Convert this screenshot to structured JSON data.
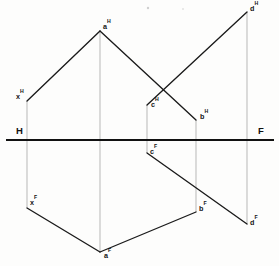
{
  "figure": {
    "type": "descriptive-geometry-projection",
    "canvas": {
      "width": 279,
      "height": 266,
      "background": "#fdfdfc"
    }
  },
  "colors": {
    "line": "#1a1a1a",
    "ground_line": "#111111",
    "projector": "#b4b4b4",
    "label": "#141414",
    "background": "#fdfdfc"
  },
  "ground_line": {
    "name": "folding-line",
    "y": 140,
    "x_start": 6,
    "x_end": 274,
    "left_label": "H",
    "right_label": "F",
    "left_label_x": 16,
    "left_label_y": 134,
    "right_label_x": 258,
    "right_label_y": 134
  },
  "points": [
    {
      "id": "xH",
      "base": "x",
      "plane": "H",
      "x": 27,
      "y": 101,
      "label_x": 16,
      "label_y": 99,
      "label_anchor": "start"
    },
    {
      "id": "aH",
      "base": "a",
      "plane": "H",
      "x": 100,
      "y": 31,
      "label_x": 103,
      "label_y": 29,
      "label_anchor": "start"
    },
    {
      "id": "cH",
      "base": "c",
      "plane": "H",
      "x": 147,
      "y": 105,
      "label_x": 151,
      "label_y": 107,
      "label_anchor": "start"
    },
    {
      "id": "bH",
      "base": "b",
      "plane": "H",
      "x": 196,
      "y": 120,
      "label_x": 200,
      "label_y": 119,
      "label_anchor": "start"
    },
    {
      "id": "dH",
      "base": "d",
      "plane": "H",
      "x": 247,
      "y": 12,
      "label_x": 250,
      "label_y": 11,
      "label_anchor": "start"
    },
    {
      "id": "xF",
      "base": "x",
      "plane": "F",
      "x": 27,
      "y": 208,
      "label_x": 30,
      "label_y": 205,
      "label_anchor": "start"
    },
    {
      "id": "aF",
      "base": "a",
      "plane": "F",
      "x": 100,
      "y": 252,
      "label_x": 104,
      "label_y": 258,
      "label_anchor": "start"
    },
    {
      "id": "cF",
      "base": "c",
      "plane": "F",
      "x": 147,
      "y": 153,
      "label_x": 150,
      "label_y": 154,
      "label_anchor": "start"
    },
    {
      "id": "bF",
      "base": "b",
      "plane": "F",
      "x": 196,
      "y": 212,
      "label_x": 199,
      "label_y": 211,
      "label_anchor": "start"
    },
    {
      "id": "dF",
      "base": "d",
      "plane": "F",
      "x": 247,
      "y": 224,
      "label_x": 250,
      "label_y": 225,
      "label_anchor": "start"
    }
  ],
  "segments": [
    {
      "name": "segment-xH-aH",
      "from": "xH",
      "to": "aH",
      "style": "solid"
    },
    {
      "name": "segment-aH-bH",
      "from": "aH",
      "to": "bH",
      "style": "solid"
    },
    {
      "name": "segment-cH-dH",
      "from": "cH",
      "to": "dH",
      "style": "solid"
    },
    {
      "name": "segment-xF-aF",
      "from": "xF",
      "to": "aF",
      "style": "solid"
    },
    {
      "name": "segment-aF-bF",
      "from": "aF",
      "to": "bF",
      "style": "solid"
    },
    {
      "name": "segment-cF-dF",
      "from": "cF",
      "to": "dF",
      "style": "solid"
    }
  ],
  "projectors": [
    {
      "name": "projector-x",
      "x": 27,
      "y_top": 101,
      "y_bottom": 208
    },
    {
      "name": "projector-a",
      "x": 100,
      "y_top": 31,
      "y_bottom": 252
    },
    {
      "name": "projector-c",
      "x": 147,
      "y_top": 105,
      "y_bottom": 153
    },
    {
      "name": "projector-b",
      "x": 196,
      "y_top": 120,
      "y_bottom": 212
    },
    {
      "name": "projector-d",
      "x": 247,
      "y_top": 12,
      "y_bottom": 224
    }
  ],
  "specks": [
    {
      "x": 148,
      "y": 8,
      "r": 1.2
    },
    {
      "x": 183,
      "y": 9,
      "r": 0.8
    }
  ]
}
